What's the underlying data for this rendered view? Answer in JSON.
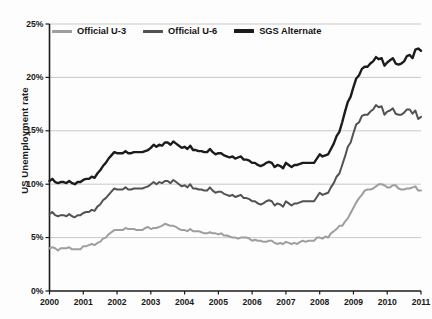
{
  "chart_data": {
    "type": "line",
    "title": "",
    "xlabel": "",
    "ylabel": "US Unemployment rate",
    "xlim": [
      2000,
      2011
    ],
    "ylim": [
      0,
      25
    ],
    "yticks": [
      "0%",
      "5%",
      "10%",
      "15%",
      "20%",
      "25%"
    ],
    "ytick_values": [
      0,
      5,
      10,
      15,
      20,
      25
    ],
    "xticks": [
      "2000",
      "2001",
      "2002",
      "2003",
      "2004",
      "2005",
      "2006",
      "2007",
      "2008",
      "2009",
      "2010",
      "2011"
    ],
    "xtick_values": [
      2000,
      2001,
      2002,
      2003,
      2004,
      2005,
      2006,
      2007,
      2008,
      2009,
      2010,
      2011
    ],
    "grid": "horizontal",
    "legend_position": "top-left-inside",
    "units": "percent",
    "x_units": "year",
    "series": [
      {
        "name": "Official U-3",
        "color": "#9e9e9e",
        "width": 2.0,
        "x": [
          2000.0,
          2000.083,
          2000.167,
          2000.25,
          2000.333,
          2000.417,
          2000.5,
          2000.583,
          2000.667,
          2000.75,
          2000.833,
          2000.917,
          2001.0,
          2001.083,
          2001.167,
          2001.25,
          2001.333,
          2001.417,
          2001.5,
          2001.583,
          2001.667,
          2001.75,
          2001.833,
          2001.917,
          2002.0,
          2002.083,
          2002.167,
          2002.25,
          2002.333,
          2002.417,
          2002.5,
          2002.583,
          2002.667,
          2002.75,
          2002.833,
          2002.917,
          2003.0,
          2003.083,
          2003.167,
          2003.25,
          2003.333,
          2003.417,
          2003.5,
          2003.583,
          2003.667,
          2003.75,
          2003.833,
          2003.917,
          2004.0,
          2004.083,
          2004.167,
          2004.25,
          2004.333,
          2004.417,
          2004.5,
          2004.583,
          2004.667,
          2004.75,
          2004.833,
          2004.917,
          2005.0,
          2005.083,
          2005.167,
          2005.25,
          2005.333,
          2005.417,
          2005.5,
          2005.583,
          2005.667,
          2005.75,
          2005.833,
          2005.917,
          2006.0,
          2006.083,
          2006.167,
          2006.25,
          2006.333,
          2006.417,
          2006.5,
          2006.583,
          2006.667,
          2006.75,
          2006.833,
          2006.917,
          2007.0,
          2007.083,
          2007.167,
          2007.25,
          2007.333,
          2007.417,
          2007.5,
          2007.583,
          2007.667,
          2007.75,
          2007.833,
          2007.917,
          2008.0,
          2008.083,
          2008.167,
          2008.25,
          2008.333,
          2008.417,
          2008.5,
          2008.583,
          2008.667,
          2008.75,
          2008.833,
          2008.917,
          2009.0,
          2009.083,
          2009.167,
          2009.25,
          2009.333,
          2009.417,
          2009.5,
          2009.583,
          2009.667,
          2009.75,
          2009.833,
          2009.917,
          2010.0,
          2010.083,
          2010.167,
          2010.25,
          2010.333,
          2010.417,
          2010.5,
          2010.583,
          2010.667,
          2010.75,
          2010.833,
          2010.917,
          2011.0
        ],
        "values": [
          4.0,
          4.1,
          4.0,
          3.8,
          4.0,
          4.0,
          4.0,
          4.1,
          3.9,
          3.9,
          3.9,
          3.9,
          4.2,
          4.2,
          4.3,
          4.4,
          4.3,
          4.5,
          4.6,
          4.9,
          5.0,
          5.3,
          5.5,
          5.7,
          5.7,
          5.7,
          5.7,
          5.9,
          5.8,
          5.8,
          5.8,
          5.7,
          5.7,
          5.7,
          5.9,
          6.0,
          5.8,
          5.9,
          5.9,
          6.0,
          6.1,
          6.3,
          6.2,
          6.1,
          6.1,
          6.0,
          5.8,
          5.7,
          5.7,
          5.6,
          5.8,
          5.6,
          5.6,
          5.6,
          5.5,
          5.4,
          5.4,
          5.5,
          5.4,
          5.4,
          5.3,
          5.4,
          5.2,
          5.2,
          5.1,
          5.0,
          5.0,
          4.9,
          5.0,
          5.0,
          5.0,
          4.9,
          4.7,
          4.8,
          4.7,
          4.7,
          4.6,
          4.6,
          4.7,
          4.7,
          4.5,
          4.4,
          4.5,
          4.4,
          4.6,
          4.5,
          4.4,
          4.5,
          4.4,
          4.6,
          4.7,
          4.6,
          4.7,
          4.7,
          4.7,
          5.0,
          5.0,
          4.9,
          5.1,
          5.0,
          5.4,
          5.6,
          5.8,
          6.1,
          6.1,
          6.5,
          6.8,
          7.3,
          7.8,
          8.3,
          8.7,
          9.0,
          9.4,
          9.5,
          9.5,
          9.6,
          9.8,
          10.0,
          10.0,
          9.9,
          9.7,
          9.7,
          9.9,
          9.9,
          9.6,
          9.5,
          9.5,
          9.6,
          9.6,
          9.7,
          9.8,
          9.4,
          9.4
        ]
      },
      {
        "name": "Official U-6",
        "color": "#525252",
        "width": 2.0,
        "x": [
          2000.0,
          2000.083,
          2000.167,
          2000.25,
          2000.333,
          2000.417,
          2000.5,
          2000.583,
          2000.667,
          2000.75,
          2000.833,
          2000.917,
          2001.0,
          2001.083,
          2001.167,
          2001.25,
          2001.333,
          2001.417,
          2001.5,
          2001.583,
          2001.667,
          2001.75,
          2001.833,
          2001.917,
          2002.0,
          2002.083,
          2002.167,
          2002.25,
          2002.333,
          2002.417,
          2002.5,
          2002.583,
          2002.667,
          2002.75,
          2002.833,
          2002.917,
          2003.0,
          2003.083,
          2003.167,
          2003.25,
          2003.333,
          2003.417,
          2003.5,
          2003.583,
          2003.667,
          2003.75,
          2003.833,
          2003.917,
          2004.0,
          2004.083,
          2004.167,
          2004.25,
          2004.333,
          2004.417,
          2004.5,
          2004.583,
          2004.667,
          2004.75,
          2004.833,
          2004.917,
          2005.0,
          2005.083,
          2005.167,
          2005.25,
          2005.333,
          2005.417,
          2005.5,
          2005.583,
          2005.667,
          2005.75,
          2005.833,
          2005.917,
          2006.0,
          2006.083,
          2006.167,
          2006.25,
          2006.333,
          2006.417,
          2006.5,
          2006.583,
          2006.667,
          2006.75,
          2006.833,
          2006.917,
          2007.0,
          2007.083,
          2007.167,
          2007.25,
          2007.333,
          2007.417,
          2007.5,
          2007.583,
          2007.667,
          2007.75,
          2007.833,
          2007.917,
          2008.0,
          2008.083,
          2008.167,
          2008.25,
          2008.333,
          2008.417,
          2008.5,
          2008.583,
          2008.667,
          2008.75,
          2008.833,
          2008.917,
          2009.0,
          2009.083,
          2009.167,
          2009.25,
          2009.333,
          2009.417,
          2009.5,
          2009.583,
          2009.667,
          2009.75,
          2009.833,
          2009.917,
          2010.0,
          2010.083,
          2010.167,
          2010.25,
          2010.333,
          2010.417,
          2010.5,
          2010.583,
          2010.667,
          2010.75,
          2010.833,
          2010.917,
          2011.0
        ],
        "values": [
          7.2,
          7.4,
          7.1,
          7.0,
          7.1,
          7.1,
          7.0,
          7.2,
          7.0,
          6.9,
          7.1,
          7.1,
          7.3,
          7.4,
          7.4,
          7.6,
          7.5,
          7.9,
          8.1,
          8.5,
          8.7,
          9.0,
          9.3,
          9.6,
          9.5,
          9.5,
          9.5,
          9.7,
          9.5,
          9.5,
          9.6,
          9.6,
          9.6,
          9.6,
          9.7,
          9.8,
          10.0,
          10.2,
          10.0,
          10.2,
          10.1,
          10.3,
          10.3,
          10.1,
          10.4,
          10.2,
          10.0,
          9.8,
          9.9,
          9.7,
          10.0,
          9.6,
          9.6,
          9.5,
          9.5,
          9.4,
          9.4,
          9.7,
          9.4,
          9.2,
          9.3,
          9.3,
          9.1,
          9.0,
          8.9,
          9.0,
          8.8,
          8.9,
          9.0,
          8.7,
          8.7,
          8.6,
          8.4,
          8.4,
          8.2,
          8.1,
          8.2,
          8.4,
          8.5,
          8.4,
          8.0,
          8.2,
          8.1,
          7.9,
          8.4,
          8.2,
          8.0,
          8.2,
          8.2,
          8.3,
          8.4,
          8.4,
          8.4,
          8.4,
          8.4,
          8.8,
          9.2,
          9.0,
          9.1,
          9.2,
          9.7,
          10.1,
          10.7,
          11.0,
          11.8,
          12.6,
          13.5,
          13.9,
          14.8,
          15.6,
          15.8,
          16.4,
          16.5,
          16.5,
          16.8,
          17.0,
          17.4,
          17.2,
          17.3,
          16.5,
          16.8,
          16.9,
          17.1,
          16.6,
          16.5,
          16.5,
          16.7,
          17.0,
          17.0,
          16.6,
          16.9,
          16.1,
          16.3
        ]
      },
      {
        "name": "SGS Alternate",
        "color": "#1c1c1c",
        "width": 2.4,
        "x": [
          2000.0,
          2000.083,
          2000.167,
          2000.25,
          2000.333,
          2000.417,
          2000.5,
          2000.583,
          2000.667,
          2000.75,
          2000.833,
          2000.917,
          2001.0,
          2001.083,
          2001.167,
          2001.25,
          2001.333,
          2001.417,
          2001.5,
          2001.583,
          2001.667,
          2001.75,
          2001.833,
          2001.917,
          2002.0,
          2002.083,
          2002.167,
          2002.25,
          2002.333,
          2002.417,
          2002.5,
          2002.583,
          2002.667,
          2002.75,
          2002.833,
          2002.917,
          2003.0,
          2003.083,
          2003.167,
          2003.25,
          2003.333,
          2003.417,
          2003.5,
          2003.583,
          2003.667,
          2003.75,
          2003.833,
          2003.917,
          2004.0,
          2004.083,
          2004.167,
          2004.25,
          2004.333,
          2004.417,
          2004.5,
          2004.583,
          2004.667,
          2004.75,
          2004.833,
          2004.917,
          2005.0,
          2005.083,
          2005.167,
          2005.25,
          2005.333,
          2005.417,
          2005.5,
          2005.583,
          2005.667,
          2005.75,
          2005.833,
          2005.917,
          2006.0,
          2006.083,
          2006.167,
          2006.25,
          2006.333,
          2006.417,
          2006.5,
          2006.583,
          2006.667,
          2006.75,
          2006.833,
          2006.917,
          2007.0,
          2007.083,
          2007.167,
          2007.25,
          2007.333,
          2007.417,
          2007.5,
          2007.583,
          2007.667,
          2007.75,
          2007.833,
          2007.917,
          2008.0,
          2008.083,
          2008.167,
          2008.25,
          2008.333,
          2008.417,
          2008.5,
          2008.583,
          2008.667,
          2008.75,
          2008.833,
          2008.917,
          2009.0,
          2009.083,
          2009.167,
          2009.25,
          2009.333,
          2009.417,
          2009.5,
          2009.583,
          2009.667,
          2009.75,
          2009.833,
          2009.917,
          2010.0,
          2010.083,
          2010.167,
          2010.25,
          2010.333,
          2010.417,
          2010.5,
          2010.583,
          2010.667,
          2010.75,
          2010.833,
          2010.917,
          2011.0
        ],
        "values": [
          10.3,
          10.5,
          10.2,
          10.1,
          10.2,
          10.2,
          10.1,
          10.3,
          10.1,
          10.0,
          10.2,
          10.2,
          10.4,
          10.5,
          10.5,
          10.7,
          10.6,
          11.0,
          11.3,
          11.7,
          12.0,
          12.4,
          12.7,
          13.0,
          12.9,
          12.9,
          12.9,
          13.1,
          12.9,
          12.9,
          13.0,
          13.0,
          13.0,
          13.0,
          13.1,
          13.2,
          13.4,
          13.7,
          13.5,
          13.7,
          13.6,
          13.9,
          13.9,
          13.7,
          14.0,
          13.8,
          13.6,
          13.4,
          13.5,
          13.3,
          13.6,
          13.2,
          13.2,
          13.1,
          13.1,
          13.0,
          13.0,
          13.3,
          13.0,
          12.8,
          12.9,
          12.9,
          12.7,
          12.6,
          12.5,
          12.6,
          12.4,
          12.5,
          12.6,
          12.3,
          12.3,
          12.2,
          12.0,
          12.0,
          11.8,
          11.7,
          11.8,
          12.0,
          12.1,
          12.0,
          11.6,
          11.8,
          11.7,
          11.5,
          12.0,
          11.8,
          11.6,
          11.8,
          11.8,
          11.9,
          12.0,
          12.0,
          12.0,
          12.0,
          12.0,
          12.4,
          12.8,
          12.6,
          12.7,
          12.8,
          13.3,
          13.8,
          14.5,
          14.9,
          15.8,
          16.8,
          17.7,
          18.2,
          19.1,
          19.9,
          20.2,
          20.8,
          21.0,
          21.0,
          21.3,
          21.5,
          21.9,
          21.7,
          21.8,
          21.1,
          21.4,
          21.6,
          21.8,
          21.3,
          21.2,
          21.3,
          21.5,
          22.0,
          22.1,
          21.8,
          22.6,
          22.7,
          22.5
        ]
      }
    ]
  },
  "axes": {
    "y_title": "US Unemployment rate"
  },
  "legend": {
    "items": [
      {
        "label": "Official U-3",
        "color": "#9e9e9e"
      },
      {
        "label": "Official U-6",
        "color": "#525252"
      },
      {
        "label": "SGS Alternate",
        "color": "#1c1c1c"
      }
    ]
  }
}
